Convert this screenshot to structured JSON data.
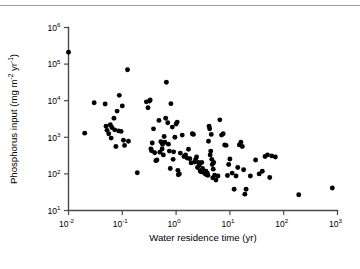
{
  "figure": {
    "top_rule_color": "#9a9a9a",
    "axis_color": "#4a4a4a",
    "marker_color": "#000000",
    "background": "#ffffff"
  },
  "chart_data": {
    "type": "scatter",
    "title": "",
    "xlabel": "Water residence time (yr)",
    "ylabel": "Phosphorus input (mg m",
    "ylabel_sup1": "-2",
    "ylabel_mid": " yr",
    "ylabel_sup2": "-1",
    "ylabel_end": ")",
    "xscale": "log",
    "yscale": "log",
    "xlim": [
      0.01,
      1000
    ],
    "ylim": [
      10,
      1000000
    ],
    "grid": false,
    "legend": null,
    "xtick_values": [
      0.01,
      0.1,
      1,
      10,
      100,
      1000
    ],
    "xtick_labels": [
      {
        "base": "10",
        "exp": "-2"
      },
      {
        "base": "10",
        "exp": "-1"
      },
      {
        "base": "10",
        "exp": "0"
      },
      {
        "base": "10",
        "exp": "1"
      },
      {
        "base": "10",
        "exp": "2"
      },
      {
        "base": "10",
        "exp": "3"
      }
    ],
    "ytick_values": [
      10,
      100,
      1000,
      10000,
      100000,
      1000000
    ],
    "ytick_labels": [
      {
        "base": "10",
        "exp": "1"
      },
      {
        "base": "10",
        "exp": "2"
      },
      {
        "base": "10",
        "exp": "3"
      },
      {
        "base": "10",
        "exp": "4"
      },
      {
        "base": "10",
        "exp": "5"
      },
      {
        "base": "10",
        "exp": "6"
      }
    ],
    "n_points": 128,
    "points": [
      [
        0.01,
        210000
      ],
      [
        0.02,
        1300
      ],
      [
        0.03,
        8800
      ],
      [
        0.048,
        8100
      ],
      [
        0.05,
        2000
      ],
      [
        0.052,
        1550
      ],
      [
        0.056,
        1250
      ],
      [
        0.06,
        2200
      ],
      [
        0.062,
        950
      ],
      [
        0.064,
        1850
      ],
      [
        0.07,
        3300
      ],
      [
        0.072,
        1600
      ],
      [
        0.076,
        560
      ],
      [
        0.08,
        5200
      ],
      [
        0.085,
        1500
      ],
      [
        0.088,
        14000
      ],
      [
        0.095,
        1450
      ],
      [
        0.1,
        7200
      ],
      [
        0.105,
        830
      ],
      [
        0.11,
        600
      ],
      [
        0.125,
        70000
      ],
      [
        0.13,
        780
      ],
      [
        0.19,
        108
      ],
      [
        0.28,
        9300
      ],
      [
        0.3,
        6400
      ],
      [
        0.32,
        9800
      ],
      [
        0.33,
        10500
      ],
      [
        0.34,
        480
      ],
      [
        0.35,
        430
      ],
      [
        0.36,
        700
      ],
      [
        0.38,
        1700
      ],
      [
        0.4,
        380
      ],
      [
        0.42,
        230
      ],
      [
        0.44,
        240
      ],
      [
        0.48,
        2900
      ],
      [
        0.5,
        390
      ],
      [
        0.52,
        760
      ],
      [
        0.55,
        480
      ],
      [
        0.56,
        640
      ],
      [
        0.58,
        330
      ],
      [
        0.6,
        1050
      ],
      [
        0.62,
        730
      ],
      [
        0.64,
        3300
      ],
      [
        0.66,
        32000
      ],
      [
        0.7,
        2500
      ],
      [
        0.72,
        650
      ],
      [
        0.75,
        420
      ],
      [
        0.78,
        140
      ],
      [
        0.8,
        8300
      ],
      [
        0.85,
        1900
      ],
      [
        0.88,
        250
      ],
      [
        0.9,
        400
      ],
      [
        0.95,
        1000
      ],
      [
        1.0,
        2300
      ],
      [
        1.05,
        2600
      ],
      [
        1.08,
        125
      ],
      [
        1.1,
        95
      ],
      [
        1.15,
        100
      ],
      [
        1.2,
        370
      ],
      [
        1.3,
        1150
      ],
      [
        1.4,
        300
      ],
      [
        1.5,
        330
      ],
      [
        1.6,
        270
      ],
      [
        1.7,
        470
      ],
      [
        1.8,
        260
      ],
      [
        1.9,
        200
      ],
      [
        2.0,
        1250
      ],
      [
        2.1,
        1200
      ],
      [
        2.2,
        210
      ],
      [
        2.3,
        245
      ],
      [
        2.4,
        290
      ],
      [
        2.5,
        150
      ],
      [
        2.6,
        205
      ],
      [
        2.7,
        175
      ],
      [
        2.8,
        120
      ],
      [
        2.9,
        115
      ],
      [
        3.0,
        205
      ],
      [
        3.1,
        140
      ],
      [
        3.2,
        125
      ],
      [
        3.3,
        108
      ],
      [
        3.4,
        112
      ],
      [
        3.5,
        100
      ],
      [
        3.6,
        118
      ],
      [
        3.7,
        95
      ],
      [
        3.8,
        105
      ],
      [
        3.9,
        92
      ],
      [
        4.0,
        780
      ],
      [
        4.1,
        2000
      ],
      [
        4.2,
        1700
      ],
      [
        4.3,
        330
      ],
      [
        4.4,
        420
      ],
      [
        4.5,
        1200
      ],
      [
        4.6,
        250
      ],
      [
        4.7,
        180
      ],
      [
        4.8,
        78
      ],
      [
        4.9,
        135
      ],
      [
        5.0,
        205
      ],
      [
        5.2,
        92
      ],
      [
        5.5,
        68
      ],
      [
        6.0,
        88
      ],
      [
        6.5,
        3000
      ],
      [
        7.0,
        1150
      ],
      [
        7.5,
        1250
      ],
      [
        8.0,
        620
      ],
      [
        8.5,
        600
      ],
      [
        9.0,
        90
      ],
      [
        9.5,
        180
      ],
      [
        10.0,
        255
      ],
      [
        11.0,
        105
      ],
      [
        12.0,
        38
      ],
      [
        13.0,
        88
      ],
      [
        14.0,
        150
      ],
      [
        15.0,
        620
      ],
      [
        16.0,
        730
      ],
      [
        17.0,
        560
      ],
      [
        18.0,
        130
      ],
      [
        19.0,
        28
      ],
      [
        20.0,
        38
      ],
      [
        24.0,
        88
      ],
      [
        30.0,
        240
      ],
      [
        35.0,
        100
      ],
      [
        40.0,
        118
      ],
      [
        45.0,
        300
      ],
      [
        50.0,
        330
      ],
      [
        55.0,
        80
      ],
      [
        60.0,
        310
      ],
      [
        70.0,
        290
      ],
      [
        190.0,
        27
      ],
      [
        800.0,
        41
      ]
    ]
  }
}
